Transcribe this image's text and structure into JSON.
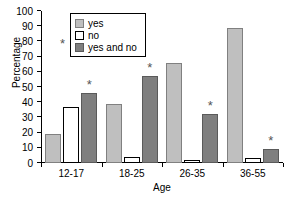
{
  "chart_data": {
    "type": "bar",
    "title": "",
    "xlabel": "Age",
    "ylabel": "Percentage",
    "categories": [
      "12-17",
      "18-25",
      "26-35",
      "36-55"
    ],
    "series": [
      {
        "name": "yes",
        "values": [
          19,
          39,
          66,
          89
        ]
      },
      {
        "name": "no",
        "values": [
          37,
          4,
          2,
          3
        ]
      },
      {
        "name": "yes and no",
        "values": [
          46,
          57,
          32,
          9
        ]
      }
    ],
    "ylim": [
      0,
      100
    ],
    "ytick_labels": [
      "0",
      "10",
      "20",
      "30",
      "40",
      "50",
      "60",
      "70",
      "80",
      "90",
      "100"
    ],
    "ytick_values": [
      0,
      10,
      20,
      30,
      40,
      50,
      60,
      70,
      80,
      90,
      100
    ],
    "grid": false,
    "legend_position": "top-center",
    "annotations": [
      {
        "series": "yes and no",
        "category": "12-17",
        "marker": "*"
      },
      {
        "series": "yes and no",
        "category": "18-25",
        "marker": "*"
      },
      {
        "series": "yes and no",
        "category": "26-35",
        "marker": "*"
      },
      {
        "series": "yes and no",
        "category": "36-55",
        "marker": "*"
      }
    ],
    "annotation_marker": "*",
    "colors": {
      "yes": "#bfbfbf",
      "no": "#ffffff",
      "yes and no": "#7f7f7f",
      "axis": "#000000",
      "star": "#555555"
    }
  },
  "legend": {
    "items": [
      {
        "label": "yes",
        "swatch": "series-yes"
      },
      {
        "label": "no",
        "swatch": "series-no"
      },
      {
        "label": "yes and no",
        "swatch": "series-yesno"
      }
    ],
    "star_marker": "*"
  }
}
